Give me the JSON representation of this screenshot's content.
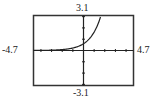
{
  "window": {
    "xmin": "-4.7",
    "xmax": "4.7",
    "ymin": "-3.1",
    "ymax": "3.1"
  },
  "chart_data": {
    "type": "line",
    "title": "",
    "xlabel": "",
    "ylabel": "",
    "xlim": [
      -4.7,
      4.7
    ],
    "ylim": [
      -3.1,
      3.1
    ],
    "grid": false,
    "x_tick_step": 1,
    "y_tick_step": 1,
    "series": [
      {
        "name": "exponential curve",
        "x": [
          -4.7,
          -4,
          -3,
          -2,
          -1,
          0,
          0.5,
          1,
          1.5,
          1.65
        ],
        "values": [
          0.01,
          0.01,
          0.03,
          0.08,
          0.22,
          0.6,
          0.99,
          1.63,
          2.69,
          3.1
        ]
      }
    ],
    "colors": {
      "axis": "#222222",
      "frame": "#333333",
      "curve": "#222222"
    }
  }
}
